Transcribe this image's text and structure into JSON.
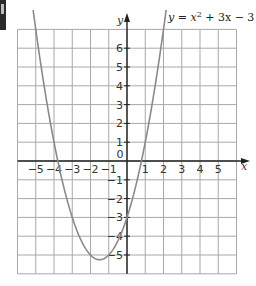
{
  "chart_data": {
    "type": "line",
    "xlabel": "x",
    "ylabel": "y",
    "xlim": [
      -6,
      6
    ],
    "ylim": [
      -6,
      7
    ],
    "grid": true,
    "x_ticks": [
      -5,
      -4,
      -3,
      -2,
      -1,
      0,
      1,
      2,
      3,
      4,
      5
    ],
    "y_ticks": [
      -5,
      -4,
      -3,
      -2,
      -1,
      1,
      2,
      3,
      4,
      5,
      6
    ],
    "series": [
      {
        "name": "y = x² + 3x − 3",
        "equation": "y = x^2 + 3x - 3",
        "color": "#8a8a8a",
        "x": [
          -5.14,
          -5,
          -4.5,
          -4,
          -3.5,
          -3,
          -2.5,
          -2,
          -1.5,
          -1,
          -0.5,
          0,
          0.5,
          1,
          1.5,
          2,
          2.14
        ],
        "values": [
          7.0,
          7.0,
          3.75,
          1.0,
          -1.25,
          -3.0,
          -4.25,
          -5.0,
          -5.25,
          -5.0,
          -4.25,
          -3.0,
          -1.25,
          1.0,
          3.75,
          7.0,
          7.0
        ]
      }
    ],
    "annotations": {
      "roots": [
        -3.79,
        0.79
      ],
      "minimum": [
        -1.5,
        -5.25
      ],
      "y_intercept": -3
    }
  },
  "labels": {
    "title_prefix": "y = x",
    "title_sup": "2",
    "title_suffix": " + 3x − 3",
    "x_axis": "x",
    "y_axis": "y",
    "origin": "0"
  },
  "colors": {
    "grid": "#a8a8a8",
    "axis": "#222222",
    "curve": "#8a8a8a"
  }
}
